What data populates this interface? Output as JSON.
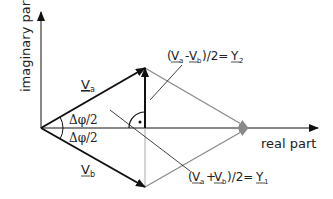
{
  "axes": {
    "x_label": "real part",
    "y_label": "imaginary part"
  },
  "vectors": {
    "va": {
      "name": "V",
      "sub": "a"
    },
    "vb": {
      "name": "V",
      "sub": "b"
    }
  },
  "angles": {
    "upper": "Δφ/2",
    "lower": "Δφ/2"
  },
  "formulas": {
    "difference": {
      "open": "(",
      "v1": "V",
      "s1": "a",
      "op": "-",
      "v2": "V",
      "s2": "b",
      "close": ")/2=",
      "result": "Y",
      "rsub": "2"
    },
    "sum": {
      "open": "(",
      "v1": "V",
      "s1": "a",
      "op": "+",
      "v2": "V",
      "s2": "b",
      "close": ")/2=",
      "result": "Y",
      "rsub": "1"
    }
  },
  "colors": {
    "primary": "#111111",
    "secondary": "#8a8a8a"
  }
}
